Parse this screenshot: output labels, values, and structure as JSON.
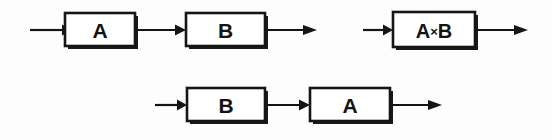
{
  "figure": {
    "background_color": "#fdfdfd",
    "line_color": "#151515",
    "box_fill": "#ffffff",
    "width": 552,
    "height": 140
  },
  "diagrams": [
    {
      "id": "diagram-1",
      "name": "series-a-then-b",
      "row": "top",
      "blocks": [
        {
          "label": "A",
          "x": 65,
          "y": 13,
          "w": 70,
          "h": 33
        },
        {
          "label": "B",
          "x": 186,
          "y": 13,
          "w": 79,
          "h": 33
        }
      ],
      "arrows": [
        {
          "name": "input-arrow",
          "x1": 30,
          "x2": 65,
          "y": 30
        },
        {
          "name": "link-arrow",
          "x1": 135,
          "x2": 186,
          "y": 30
        },
        {
          "name": "output-arrow",
          "x1": 265,
          "x2": 316,
          "y": 30
        }
      ]
    },
    {
      "id": "diagram-2",
      "name": "product-a-times-b",
      "row": "top",
      "blocks": [
        {
          "label": "A×B",
          "label_left": "A",
          "label_op": "×",
          "label_right": "B",
          "x": 393,
          "y": 12,
          "w": 82,
          "h": 35
        }
      ],
      "arrows": [
        {
          "name": "input-arrow",
          "x1": 363,
          "x2": 393,
          "y": 30
        },
        {
          "name": "output-arrow",
          "x1": 475,
          "x2": 527,
          "y": 30
        }
      ]
    },
    {
      "id": "diagram-3",
      "name": "series-b-then-a",
      "row": "bottom",
      "blocks": [
        {
          "label": "B",
          "x": 187,
          "y": 88,
          "w": 78,
          "h": 33
        },
        {
          "label": "A",
          "x": 310,
          "y": 88,
          "w": 80,
          "h": 33
        }
      ],
      "arrows": [
        {
          "name": "input-arrow",
          "x1": 155,
          "x2": 187,
          "y": 105
        },
        {
          "name": "link-arrow",
          "x1": 265,
          "x2": 310,
          "y": 105
        },
        {
          "name": "output-arrow",
          "x1": 390,
          "x2": 441,
          "y": 105
        }
      ]
    }
  ],
  "labels": {
    "a": "A",
    "b": "B",
    "times": "×",
    "a_times_b": "A×B"
  }
}
